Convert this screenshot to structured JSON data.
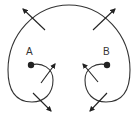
{
  "diagram": {
    "colors": {
      "stroke": "#333333",
      "background": "#ffffff"
    },
    "points": [
      {
        "id": "A",
        "label": "A",
        "x": 31,
        "y": 65,
        "label_x": 29,
        "label_y": 55
      },
      {
        "id": "B",
        "label": "B",
        "x": 107,
        "y": 65,
        "label_x": 104,
        "label_y": 55
      }
    ],
    "arrows": [
      {
        "name": "top-left",
        "from": [
          45,
          30
        ],
        "to": [
          23,
          9
        ]
      },
      {
        "name": "top-right",
        "from": [
          93,
          30
        ],
        "to": [
          115,
          9
        ]
      },
      {
        "name": "inner-left",
        "from": [
          41,
          83
        ],
        "to": [
          55,
          64
        ]
      },
      {
        "name": "inner-right",
        "from": [
          98,
          82
        ],
        "to": [
          83,
          64
        ]
      },
      {
        "name": "bottom-left",
        "from": [
          33,
          93
        ],
        "to": [
          51,
          111
        ]
      },
      {
        "name": "bottom-right",
        "from": [
          107,
          93
        ],
        "to": [
          90,
          111
        ]
      }
    ]
  }
}
